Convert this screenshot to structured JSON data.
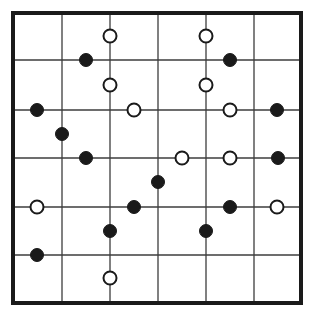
{
  "figure": {
    "type": "diagram",
    "width": 318,
    "height": 317,
    "background_color": "#ffffff"
  },
  "board": {
    "name": "6x6 lattice board",
    "outer_border": {
      "left": 13,
      "top": 13,
      "right": 301,
      "bottom": 303,
      "color": "#1a1a1a",
      "stroke_width": 4
    },
    "grid_lines": {
      "color": "#3c3c3c",
      "stroke_width": 1.3,
      "vertical_x": [
        62,
        110,
        158,
        206,
        254
      ],
      "horizontal_y": [
        60,
        110,
        158,
        207,
        255
      ]
    },
    "cell_count_x": 6,
    "cell_count_y": 6
  },
  "legend": {
    "black_label": "black stone",
    "white_label": "white stone"
  },
  "stones": {
    "radius": 6.5,
    "black_fill": "#1a1a1a",
    "white_fill": "#ffffff",
    "white_stroke": "#1a1a1a",
    "white_stroke_width": 2,
    "items": [
      {
        "color": "black",
        "x": 86,
        "y": 60
      },
      {
        "color": "black",
        "x": 230,
        "y": 60
      },
      {
        "color": "black",
        "x": 37,
        "y": 110
      },
      {
        "color": "black",
        "x": 277,
        "y": 110
      },
      {
        "color": "black",
        "x": 62,
        "y": 134
      },
      {
        "color": "black",
        "x": 86,
        "y": 158
      },
      {
        "color": "black",
        "x": 278,
        "y": 158
      },
      {
        "color": "black",
        "x": 158,
        "y": 182
      },
      {
        "color": "black",
        "x": 134,
        "y": 207
      },
      {
        "color": "black",
        "x": 230,
        "y": 207
      },
      {
        "color": "black",
        "x": 110,
        "y": 231
      },
      {
        "color": "black",
        "x": 206,
        "y": 231
      },
      {
        "color": "black",
        "x": 37,
        "y": 255
      },
      {
        "color": "white",
        "x": 110,
        "y": 36
      },
      {
        "color": "white",
        "x": 206,
        "y": 36
      },
      {
        "color": "white",
        "x": 110,
        "y": 85
      },
      {
        "color": "white",
        "x": 206,
        "y": 85
      },
      {
        "color": "white",
        "x": 134,
        "y": 110
      },
      {
        "color": "white",
        "x": 230,
        "y": 110
      },
      {
        "color": "white",
        "x": 182,
        "y": 158
      },
      {
        "color": "white",
        "x": 230,
        "y": 158
      },
      {
        "color": "white",
        "x": 37,
        "y": 207
      },
      {
        "color": "white",
        "x": 277,
        "y": 207
      },
      {
        "color": "white",
        "x": 110,
        "y": 278
      }
    ]
  }
}
